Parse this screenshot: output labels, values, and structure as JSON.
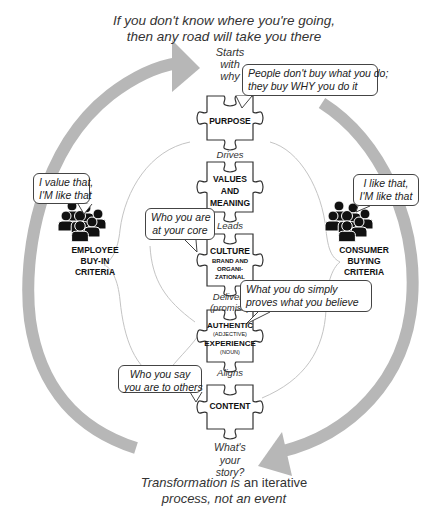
{
  "header": {
    "quote_line1": "If you don't know where you're going,",
    "quote_line2": "then any road will take you there"
  },
  "footer": {
    "line1_em": "Transformation is",
    "line1_rest": " an iterative",
    "line2": "process, not an event"
  },
  "start_label": [
    "Starts",
    "with",
    "why"
  ],
  "end_label": [
    "What's",
    "your",
    "story?"
  ],
  "puzzle_pieces": [
    {
      "id": "purpose",
      "lines": [
        "PURPOSE"
      ]
    },
    {
      "id": "values",
      "lines": [
        "VALUES",
        "AND",
        "MEANING"
      ]
    },
    {
      "id": "culture",
      "lines": [
        "CULTURE"
      ],
      "sub": [
        "BRAND AND",
        "ORGANI-",
        "ZATIONAL"
      ]
    },
    {
      "id": "experience",
      "lines": [
        "AUTHENTIC",
        "(ADJECTIVE)",
        "EXPERIENCE",
        "(NOUN)"
      ]
    },
    {
      "id": "content",
      "lines": [
        "CONTENT"
      ]
    }
  ],
  "connectors": [
    "Drives",
    "Leads",
    "Delivers",
    "(promise)",
    "Aligns"
  ],
  "bubbles": {
    "purpose": [
      "People don't buy what you do;",
      "they buy WHY you do it"
    ],
    "culture": [
      "Who you are",
      "at your core"
    ],
    "experience": [
      "What you do simply",
      "proves what you believe"
    ],
    "content": [
      "Who you say",
      "you are to others"
    ],
    "employee": [
      "I value that,",
      "I'M like that"
    ],
    "consumer": [
      "I like that,",
      "I'M like that"
    ]
  },
  "groups": {
    "employee": [
      "EMPLOYEE",
      "BUY-IN",
      "CRITERIA"
    ],
    "consumer": [
      "CONSUMER",
      "BUYING",
      "CRITERIA"
    ]
  },
  "icons": {
    "people": "people-group-icon",
    "arrow": "cycle-arrow-icon",
    "puzzle": "puzzle-piece-icon"
  },
  "colors": {
    "arrow": "#b5b5b5",
    "line": "#bbbbbb",
    "stroke": "#333333",
    "text": "#222222"
  }
}
